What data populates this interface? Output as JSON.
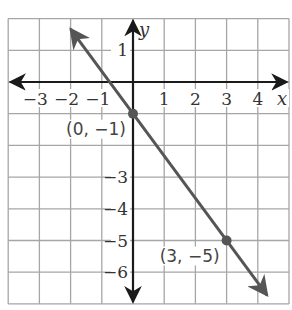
{
  "chart_data": {
    "type": "line",
    "title": "",
    "xlabel": "x",
    "ylabel": "y",
    "xlim": [
      -4,
      5
    ],
    "ylim": [
      -7,
      2
    ],
    "grid": true,
    "x_tick_labels": [
      "−3",
      "−2",
      "−1",
      "1",
      "2",
      "3",
      "4"
    ],
    "x_tick_values": [
      -3,
      -2,
      -1,
      1,
      2,
      3,
      4
    ],
    "y_tick_labels": [
      "1",
      "−3",
      "−4",
      "−5",
      "−6"
    ],
    "y_tick_values": [
      1,
      -3,
      -4,
      -5,
      -6
    ],
    "series": [
      {
        "name": "line",
        "equation": "y = -4/3 x - 1",
        "x": [
          -2,
          4.3
        ],
        "y": [
          1.67,
          -6.73
        ],
        "color": "#555555",
        "arrows": "both"
      }
    ],
    "points": [
      {
        "x": 0,
        "y": -1,
        "label": "(0, −1)"
      },
      {
        "x": 3,
        "y": -5,
        "label": "(3, −5)"
      }
    ]
  },
  "colors": {
    "grid": "#a6a6a6",
    "axis": "#1a1a1a",
    "line": "#555555",
    "point": "#555555"
  }
}
